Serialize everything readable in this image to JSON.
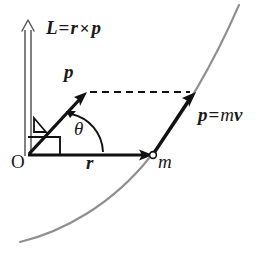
{
  "figure": {
    "background_color": "#ffffff",
    "ink_color": "#1a1a1a",
    "curve_color": "#8c8c8c",
    "width": 276,
    "height": 260
  },
  "labels": {
    "angular_momentum": {
      "vector": "L",
      "equals": "=",
      "r": "r",
      "cross": "×",
      "p": "p"
    },
    "momentum_short": "p",
    "momentum_def": {
      "p": "p",
      "equals": "=",
      "m": "m",
      "v": "v"
    },
    "angle": "θ",
    "radius": "r",
    "mass": "m",
    "origin": "O"
  },
  "geometry": {
    "origin": {
      "x": 28,
      "y": 155
    },
    "L_axis_top": {
      "x": 28,
      "y": 22
    },
    "p_vector_tip": {
      "x": 86,
      "y": 93
    },
    "r_vector_tip": {
      "x": 152,
      "y": 155
    },
    "particle": {
      "x": 153,
      "y": 155
    },
    "pmv_tip": {
      "x": 196,
      "y": 93
    },
    "dashed_from": {
      "x": 88,
      "y": 92
    },
    "dashed_to": {
      "x": 192,
      "y": 92
    },
    "trajectory_start": {
      "x": 20,
      "y": 242
    },
    "trajectory_end": {
      "x": 239,
      "y": 5
    }
  },
  "elements": {
    "angular_momentum_axis": "hollow-up-arrow",
    "momentum_arrow": "solid-arrow",
    "radius_arrow": "solid-arrow",
    "momentum_tangent_arrow": "solid-arrow",
    "projection_line": "dashed",
    "angle_arc": "theta-arc-with-arrowhead",
    "right_angle_marker": "square",
    "small_angle_marker": "wedge",
    "particle_marker": "open-circle",
    "trajectory": "grey-curve"
  }
}
